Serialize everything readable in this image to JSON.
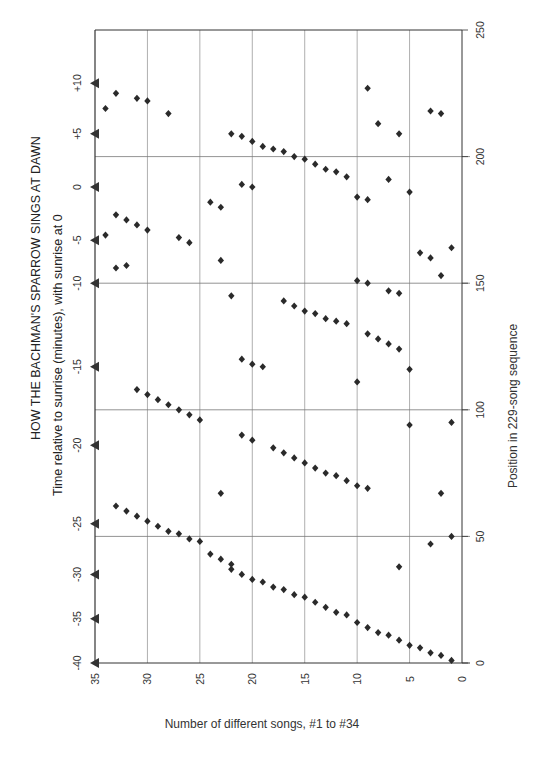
{
  "chart_data": {
    "type": "scatter",
    "title": "HOW THE BACHMAN'S SPARROW SINGS AT DAWN",
    "subtitle": "Time relative to sunrise (minutes), with sunrise at 0",
    "xlabel": "Number of different songs, #1 to #34",
    "ylabel": "Position in 229-song sequence",
    "orientation_note": "Chart is printed rotated 90 degrees; song number runs right-to-left along the bottom, sequence position runs bottom-to-top on the right",
    "xlim": [
      0,
      35
    ],
    "ylim": [
      0,
      250
    ],
    "x_ticks": [
      0,
      5,
      10,
      15,
      20,
      25,
      30,
      35
    ],
    "y_ticks": [
      0,
      50,
      100,
      150,
      200,
      250
    ],
    "grid": true,
    "time_axis": {
      "label": "Time relative to sunrise (minutes), with sunrise at 0",
      "ticks": [
        "-40",
        "-35",
        "-30",
        "-25",
        "-20",
        "-15",
        "-10",
        "-5",
        "0",
        "+5",
        "+10"
      ],
      "tick_positions": [
        0,
        17.5,
        35,
        55,
        86,
        117,
        150,
        167,
        188,
        209,
        229
      ],
      "marker": "triangle-left"
    },
    "series": [
      {
        "name": "Songs sung (song number vs. position in sequence)",
        "marker": "diamond",
        "points": [
          [
            1,
            1
          ],
          [
            2,
            3
          ],
          [
            3,
            4
          ],
          [
            4,
            6
          ],
          [
            5,
            7
          ],
          [
            6,
            9
          ],
          [
            7,
            11
          ],
          [
            8,
            12
          ],
          [
            9,
            14
          ],
          [
            10,
            16
          ],
          [
            11,
            19
          ],
          [
            12,
            20
          ],
          [
            13,
            22
          ],
          [
            14,
            24
          ],
          [
            15,
            26
          ],
          [
            16,
            27
          ],
          [
            17,
            29
          ],
          [
            18,
            30
          ],
          [
            19,
            32
          ],
          [
            20,
            33
          ],
          [
            21,
            35
          ],
          [
            22,
            37
          ],
          [
            22,
            39
          ],
          [
            23,
            41
          ],
          [
            24,
            43
          ],
          [
            25,
            48
          ],
          [
            26,
            49
          ],
          [
            27,
            51
          ],
          [
            28,
            52
          ],
          [
            29,
            54
          ],
          [
            30,
            56
          ],
          [
            31,
            58
          ],
          [
            32,
            60
          ],
          [
            33,
            62
          ],
          [
            6,
            38
          ],
          [
            3,
            47
          ],
          [
            1,
            50
          ],
          [
            2,
            67
          ],
          [
            23,
            67
          ],
          [
            9,
            69
          ],
          [
            10,
            70
          ],
          [
            11,
            72
          ],
          [
            12,
            74
          ],
          [
            13,
            75
          ],
          [
            14,
            77
          ],
          [
            15,
            79
          ],
          [
            16,
            81
          ],
          [
            17,
            83
          ],
          [
            18,
            85
          ],
          [
            20,
            88
          ],
          [
            21,
            90
          ],
          [
            1,
            95
          ],
          [
            5,
            94
          ],
          [
            25,
            96
          ],
          [
            26,
            98
          ],
          [
            27,
            100
          ],
          [
            28,
            102
          ],
          [
            29,
            104
          ],
          [
            30,
            106
          ],
          [
            31,
            108
          ],
          [
            10,
            111
          ],
          [
            5,
            116
          ],
          [
            19,
            117
          ],
          [
            20,
            118
          ],
          [
            21,
            120
          ],
          [
            6,
            124
          ],
          [
            7,
            126
          ],
          [
            8,
            128
          ],
          [
            9,
            130
          ],
          [
            11,
            134
          ],
          [
            12,
            135
          ],
          [
            13,
            136
          ],
          [
            14,
            138
          ],
          [
            15,
            139
          ],
          [
            16,
            141
          ],
          [
            17,
            143
          ],
          [
            22,
            145
          ],
          [
            6,
            146
          ],
          [
            7,
            147
          ],
          [
            9,
            150
          ],
          [
            10,
            151
          ],
          [
            2,
            153
          ],
          [
            33,
            156
          ],
          [
            32,
            157
          ],
          [
            3,
            160
          ],
          [
            23,
            159
          ],
          [
            4,
            162
          ],
          [
            1,
            164
          ],
          [
            26,
            166
          ],
          [
            27,
            168
          ],
          [
            34,
            169
          ],
          [
            30,
            171
          ],
          [
            31,
            173
          ],
          [
            32,
            175
          ],
          [
            33,
            177
          ],
          [
            23,
            180
          ],
          [
            24,
            182
          ],
          [
            9,
            183
          ],
          [
            10,
            184
          ],
          [
            20,
            188
          ],
          [
            21,
            189
          ],
          [
            5,
            186
          ],
          [
            7,
            191
          ],
          [
            11,
            192
          ],
          [
            12,
            194
          ],
          [
            13,
            195
          ],
          [
            14,
            197
          ],
          [
            15,
            199
          ],
          [
            16,
            200
          ],
          [
            17,
            202
          ],
          [
            18,
            203
          ],
          [
            19,
            204
          ],
          [
            20,
            206
          ],
          [
            21,
            208
          ],
          [
            22,
            209
          ],
          [
            6,
            209
          ],
          [
            8,
            213
          ],
          [
            28,
            217
          ],
          [
            2,
            217
          ],
          [
            3,
            218
          ],
          [
            34,
            219
          ],
          [
            30,
            222
          ],
          [
            31,
            223
          ],
          [
            33,
            225
          ],
          [
            9,
            227
          ]
        ]
      }
    ]
  },
  "labels": {
    "title": "HOW THE BACHMAN'S SPARROW SINGS AT DAWN",
    "subtitle": "Time relative to sunrise (minutes), with sunrise at 0",
    "x_axis_title": "Number of different songs, #1 to #34",
    "right_axis_title": "Position in 229-song sequence"
  },
  "colors": {
    "point": "#2a2a2a",
    "grid": "#9a9a9a",
    "axis": "#333333",
    "text": "#222222"
  }
}
